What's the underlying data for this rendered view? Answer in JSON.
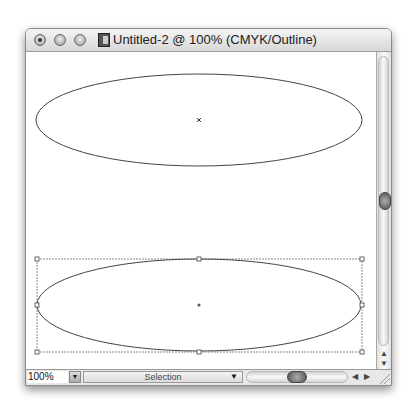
{
  "window": {
    "title": "Untitled-2 @ 100% (CMYK/Outline)",
    "traffic_lights": [
      "close",
      "minimize",
      "zoom"
    ]
  },
  "canvas": {
    "objects": [
      {
        "type": "ellipse",
        "selected": false,
        "cx": 173,
        "cy": 68,
        "rx": 163,
        "ry": 46
      },
      {
        "type": "ellipse",
        "selected": true,
        "cx": 173,
        "cy": 253,
        "rx": 163,
        "ry": 46
      }
    ]
  },
  "statusbar": {
    "zoom_value": "100%",
    "tool_label": "Selection"
  },
  "scroll": {
    "up_arrow": "▲",
    "down_arrow": "▼",
    "left_arrow": "◀",
    "right_arrow": "▶"
  },
  "colors": {
    "stroke": "#444444",
    "selection": "#777777"
  }
}
